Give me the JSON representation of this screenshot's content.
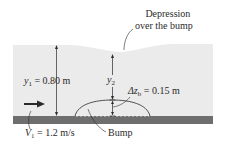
{
  "labels": {
    "depression": [
      "Depression",
      "over the bump"
    ],
    "y1_symbol": "y",
    "y1_sub": "1",
    "y1_value": " = 0.80 m",
    "y2_symbol": "y",
    "y2_sub": "2",
    "dz_symbol": "Δz",
    "dz_sub": "b",
    "dz_value": " = 0.15 m",
    "v1_symbol": "V",
    "v1_sub": "1",
    "v1_value": " = 1.2 m/s",
    "bump": "Bump"
  },
  "colors": {
    "water": "#ebebeb",
    "channel_bed": "#6e6e6e",
    "lines": "#2a2a2a"
  }
}
